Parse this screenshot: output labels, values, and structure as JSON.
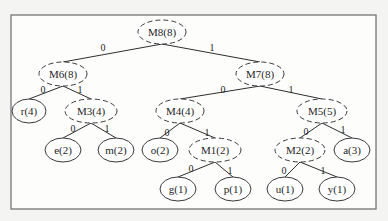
{
  "diagram": {
    "type": "huffman-tree",
    "frame": {
      "x": 11,
      "y": 15,
      "w": 365,
      "h": 194
    },
    "nodes": [
      {
        "id": "M8",
        "label": "M8(8)",
        "kind": "internal",
        "cx": 162,
        "cy": 32,
        "rx": 24,
        "ry": 12
      },
      {
        "id": "M6",
        "label": "M6(8)",
        "kind": "internal",
        "cx": 63,
        "cy": 74,
        "rx": 24,
        "ry": 12
      },
      {
        "id": "M7",
        "label": "M7(8)",
        "kind": "internal",
        "cx": 260,
        "cy": 74,
        "rx": 24,
        "ry": 12
      },
      {
        "id": "r",
        "label": "r(4)",
        "kind": "leaf",
        "cx": 29,
        "cy": 111,
        "rx": 17,
        "ry": 12
      },
      {
        "id": "M3",
        "label": "M3(4)",
        "kind": "internal",
        "cx": 91,
        "cy": 111,
        "rx": 26,
        "ry": 12
      },
      {
        "id": "M4",
        "label": "M4(4)",
        "kind": "internal",
        "cx": 180,
        "cy": 111,
        "rx": 24,
        "ry": 12
      },
      {
        "id": "M5",
        "label": "M5(5)",
        "kind": "internal",
        "cx": 322,
        "cy": 111,
        "rx": 25,
        "ry": 12
      },
      {
        "id": "e",
        "label": "e(2)",
        "kind": "leaf",
        "cx": 63,
        "cy": 150,
        "rx": 18,
        "ry": 12
      },
      {
        "id": "m",
        "label": "m(2)",
        "kind": "leaf",
        "cx": 116,
        "cy": 150,
        "rx": 18,
        "ry": 12
      },
      {
        "id": "o",
        "label": "o(2)",
        "kind": "leaf",
        "cx": 160,
        "cy": 150,
        "rx": 18,
        "ry": 12
      },
      {
        "id": "M1",
        "label": "M1(2)",
        "kind": "internal",
        "cx": 215,
        "cy": 150,
        "rx": 26,
        "ry": 12
      },
      {
        "id": "M2",
        "label": "M2(2)",
        "kind": "internal",
        "cx": 300,
        "cy": 150,
        "rx": 25,
        "ry": 12
      },
      {
        "id": "a",
        "label": "a(3)",
        "kind": "leaf",
        "cx": 352,
        "cy": 150,
        "rx": 18,
        "ry": 12
      },
      {
        "id": "g",
        "label": "g(1)",
        "kind": "leaf",
        "cx": 178,
        "cy": 189,
        "rx": 18,
        "ry": 12
      },
      {
        "id": "p",
        "label": "p(1)",
        "kind": "leaf",
        "cx": 233,
        "cy": 189,
        "rx": 18,
        "ry": 12
      },
      {
        "id": "u",
        "label": "u(1)",
        "kind": "leaf",
        "cx": 285,
        "cy": 189,
        "rx": 18,
        "ry": 12
      },
      {
        "id": "y",
        "label": "y(1)",
        "kind": "leaf",
        "cx": 337,
        "cy": 189,
        "rx": 18,
        "ry": 12
      }
    ],
    "edges": [
      {
        "from": "M8",
        "to": "M6",
        "bit": "0",
        "lx": 103,
        "ly": 47
      },
      {
        "from": "M8",
        "to": "M7",
        "bit": "1",
        "lx": 212,
        "ly": 47
      },
      {
        "from": "M6",
        "to": "r",
        "bit": "0",
        "lx": 43,
        "ly": 89
      },
      {
        "from": "M6",
        "to": "M3",
        "bit": "1",
        "lx": 80,
        "ly": 89
      },
      {
        "from": "M7",
        "to": "M4",
        "bit": "0",
        "lx": 223,
        "ly": 89
      },
      {
        "from": "M7",
        "to": "M5",
        "bit": "1",
        "lx": 291,
        "ly": 89
      },
      {
        "from": "M3",
        "to": "e",
        "bit": "0",
        "lx": 73,
        "ly": 128
      },
      {
        "from": "M3",
        "to": "m",
        "bit": "1",
        "lx": 107,
        "ly": 128
      },
      {
        "from": "M4",
        "to": "o",
        "bit": "0",
        "lx": 167,
        "ly": 132
      },
      {
        "from": "M4",
        "to": "M1",
        "bit": "1",
        "lx": 207,
        "ly": 132
      },
      {
        "from": "M5",
        "to": "M2",
        "bit": "0",
        "lx": 306,
        "ly": 131
      },
      {
        "from": "M5",
        "to": "a",
        "bit": "1",
        "lx": 343,
        "ly": 129
      },
      {
        "from": "M1",
        "to": "g",
        "bit": "0",
        "lx": 191,
        "ly": 168
      },
      {
        "from": "M1",
        "to": "p",
        "bit": "1",
        "lx": 230,
        "ly": 170
      },
      {
        "from": "M2",
        "to": "u",
        "bit": "0",
        "lx": 284,
        "ly": 170
      },
      {
        "from": "M2",
        "to": "y",
        "bit": "1",
        "lx": 323,
        "ly": 170
      }
    ]
  }
}
